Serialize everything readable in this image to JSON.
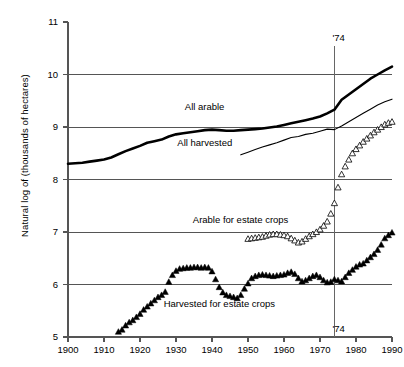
{
  "chart_data": {
    "type": "line",
    "title": "",
    "xlabel": "",
    "ylabel": "Natural log of (thousands of hectares)",
    "xlim": [
      1900,
      1990
    ],
    "ylim": [
      5,
      11
    ],
    "grid": true,
    "gridlines_y": [
      6,
      7,
      8,
      9,
      10
    ],
    "legend_position": "inline-annotations",
    "x_ticks": [
      1900,
      1910,
      1920,
      1930,
      1940,
      1950,
      1960,
      1970,
      1980,
      1990
    ],
    "x_tick_labels": [
      "1900",
      "1910",
      "1920",
      "1930",
      "1940",
      "1950",
      "1960",
      "1970",
      "1980",
      "1990"
    ],
    "y_ticks": [
      5,
      6,
      7,
      8,
      9,
      10,
      11
    ],
    "y_tick_labels": [
      "5",
      "6",
      "7",
      "8",
      "9",
      "10",
      "11"
    ],
    "annotations": [
      {
        "name": "reference-line-1974",
        "x": 1974,
        "label": "'74",
        "label_positions": [
          "top",
          "bottom"
        ],
        "y_top": 10.55,
        "y_bottom": 5.0
      }
    ],
    "series": [
      {
        "name": "All arable",
        "marker": "none",
        "style": "thick-line",
        "color": "#000000",
        "linewidth": 2.6,
        "label_x": 1938,
        "label_y": 9.38,
        "x": [
          1900,
          1902,
          1904,
          1906,
          1908,
          1910,
          1912,
          1914,
          1916,
          1918,
          1920,
          1922,
          1924,
          1926,
          1928,
          1930,
          1932,
          1934,
          1936,
          1938,
          1940,
          1942,
          1944,
          1946,
          1948,
          1950,
          1952,
          1954,
          1956,
          1958,
          1960,
          1962,
          1964,
          1966,
          1968,
          1970,
          1972,
          1974,
          1976,
          1978,
          1980,
          1982,
          1984,
          1986,
          1988,
          1990
        ],
        "y": [
          8.3,
          8.31,
          8.32,
          8.34,
          8.36,
          8.38,
          8.42,
          8.48,
          8.54,
          8.59,
          8.64,
          8.7,
          8.73,
          8.76,
          8.82,
          8.86,
          8.88,
          8.9,
          8.92,
          8.94,
          8.95,
          8.94,
          8.93,
          8.93,
          8.94,
          8.95,
          8.96,
          8.97,
          8.99,
          9.01,
          9.04,
          9.07,
          9.1,
          9.13,
          9.16,
          9.2,
          9.26,
          9.33,
          9.52,
          9.62,
          9.72,
          9.82,
          9.92,
          10.0,
          10.08,
          10.15
        ]
      },
      {
        "name": "All harvested",
        "marker": "none",
        "style": "thin-line",
        "color": "#000000",
        "linewidth": 1.1,
        "label_x": 1938,
        "label_y": 8.7,
        "x": [
          1948,
          1950,
          1952,
          1954,
          1956,
          1958,
          1960,
          1962,
          1964,
          1966,
          1968,
          1970,
          1972,
          1974,
          1976,
          1978,
          1980,
          1982,
          1984,
          1986,
          1988,
          1990
        ],
        "y": [
          8.47,
          8.52,
          8.57,
          8.62,
          8.66,
          8.7,
          8.75,
          8.8,
          8.82,
          8.86,
          8.88,
          8.92,
          8.96,
          8.95,
          9.02,
          9.1,
          9.18,
          9.26,
          9.34,
          9.42,
          9.48,
          9.53
        ]
      },
      {
        "name": "Arable for estate crops",
        "marker": "open-triangle",
        "style": "markers",
        "color": "#000000",
        "label_x": 1948,
        "label_y": 7.22,
        "x": [
          1950,
          1951,
          1952,
          1953,
          1954,
          1955,
          1956,
          1957,
          1958,
          1959,
          1960,
          1961,
          1962,
          1963,
          1964,
          1965,
          1966,
          1967,
          1968,
          1969,
          1970,
          1971,
          1972,
          1973,
          1974,
          1975,
          1976,
          1977,
          1978,
          1979,
          1980,
          1981,
          1982,
          1983,
          1984,
          1985,
          1986,
          1987,
          1988,
          1989,
          1990
        ],
        "y": [
          6.87,
          6.88,
          6.89,
          6.9,
          6.91,
          6.93,
          6.95,
          6.96,
          6.96,
          6.95,
          6.94,
          6.92,
          6.88,
          6.84,
          6.8,
          6.82,
          6.87,
          6.92,
          6.96,
          7.0,
          7.05,
          7.12,
          7.2,
          7.35,
          7.55,
          7.85,
          8.1,
          8.25,
          8.38,
          8.5,
          8.58,
          8.65,
          8.72,
          8.78,
          8.84,
          8.9,
          8.95,
          9.0,
          9.05,
          9.08,
          9.1
        ]
      },
      {
        "name": "Harvested for estate crops",
        "marker": "filled-triangle",
        "style": "markers",
        "color": "#000000",
        "label_x": 1942,
        "label_y": 5.62,
        "x": [
          1914,
          1915,
          1916,
          1917,
          1918,
          1919,
          1920,
          1921,
          1922,
          1923,
          1924,
          1925,
          1926,
          1927,
          1928,
          1929,
          1930,
          1931,
          1932,
          1933,
          1934,
          1935,
          1936,
          1937,
          1938,
          1939,
          1940,
          1941,
          1942,
          1943,
          1944,
          1945,
          1946,
          1947,
          1948,
          1949,
          1950,
          1951,
          1952,
          1953,
          1954,
          1955,
          1956,
          1957,
          1958,
          1959,
          1960,
          1961,
          1962,
          1963,
          1964,
          1965,
          1966,
          1967,
          1968,
          1969,
          1970,
          1971,
          1972,
          1973,
          1974,
          1975,
          1976,
          1977,
          1978,
          1979,
          1980,
          1981,
          1982,
          1983,
          1984,
          1985,
          1986,
          1987,
          1988,
          1989,
          1990
        ],
        "y": [
          5.1,
          5.14,
          5.22,
          5.28,
          5.32,
          5.38,
          5.44,
          5.52,
          5.58,
          5.64,
          5.7,
          5.76,
          5.8,
          5.86,
          6.05,
          6.18,
          6.26,
          6.3,
          6.31,
          6.32,
          6.32,
          6.33,
          6.33,
          6.32,
          6.33,
          6.32,
          6.25,
          6.1,
          5.95,
          5.85,
          5.8,
          5.78,
          5.76,
          5.74,
          5.8,
          5.92,
          6.02,
          6.12,
          6.16,
          6.18,
          6.19,
          6.18,
          6.17,
          6.16,
          6.17,
          6.18,
          6.19,
          6.22,
          6.24,
          6.2,
          6.12,
          6.06,
          6.08,
          6.12,
          6.16,
          6.18,
          6.14,
          6.08,
          6.04,
          6.05,
          6.1,
          6.08,
          6.06,
          6.14,
          6.22,
          6.28,
          6.34,
          6.38,
          6.4,
          6.46,
          6.52,
          6.58,
          6.66,
          6.76,
          6.88,
          6.94,
          6.99
        ]
      }
    ]
  }
}
